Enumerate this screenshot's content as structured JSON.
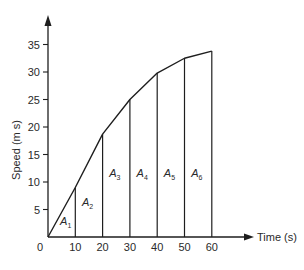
{
  "chart_data": {
    "type": "line",
    "title": "",
    "xlabel": "Time (s)",
    "ylabel": "Speed (m s)",
    "x": [
      0,
      10,
      20,
      30,
      40,
      50,
      60
    ],
    "series": [
      {
        "name": "Speed",
        "values": [
          0,
          9,
          18.7,
          25,
          29.8,
          32.5,
          33.8
        ]
      }
    ],
    "xticks": [
      0,
      10,
      20,
      30,
      40,
      50,
      60
    ],
    "yticks": [
      5,
      10,
      15,
      20,
      25,
      30,
      35
    ],
    "xlim": [
      0,
      65
    ],
    "ylim": [
      0,
      40
    ],
    "grid": false,
    "legend": null,
    "vertical_lines_at_x": [
      10,
      20,
      30,
      40,
      50,
      60
    ],
    "annotations": [
      {
        "text": "A",
        "sub": "1",
        "x": 6.5,
        "y": 2.2
      },
      {
        "text": "A",
        "sub": "2",
        "x": 14.5,
        "y": 5.6
      },
      {
        "text": "A",
        "sub": "3",
        "x": 24.5,
        "y": 11
      },
      {
        "text": "A",
        "sub": "4",
        "x": 34.5,
        "y": 11
      },
      {
        "text": "A",
        "sub": "5",
        "x": 44.5,
        "y": 11
      },
      {
        "text": "A",
        "sub": "6",
        "x": 54.5,
        "y": 11
      }
    ]
  },
  "labels": {
    "x_axis": "Time (s)",
    "y_axis": "Speed (m s)",
    "origin": "0"
  }
}
